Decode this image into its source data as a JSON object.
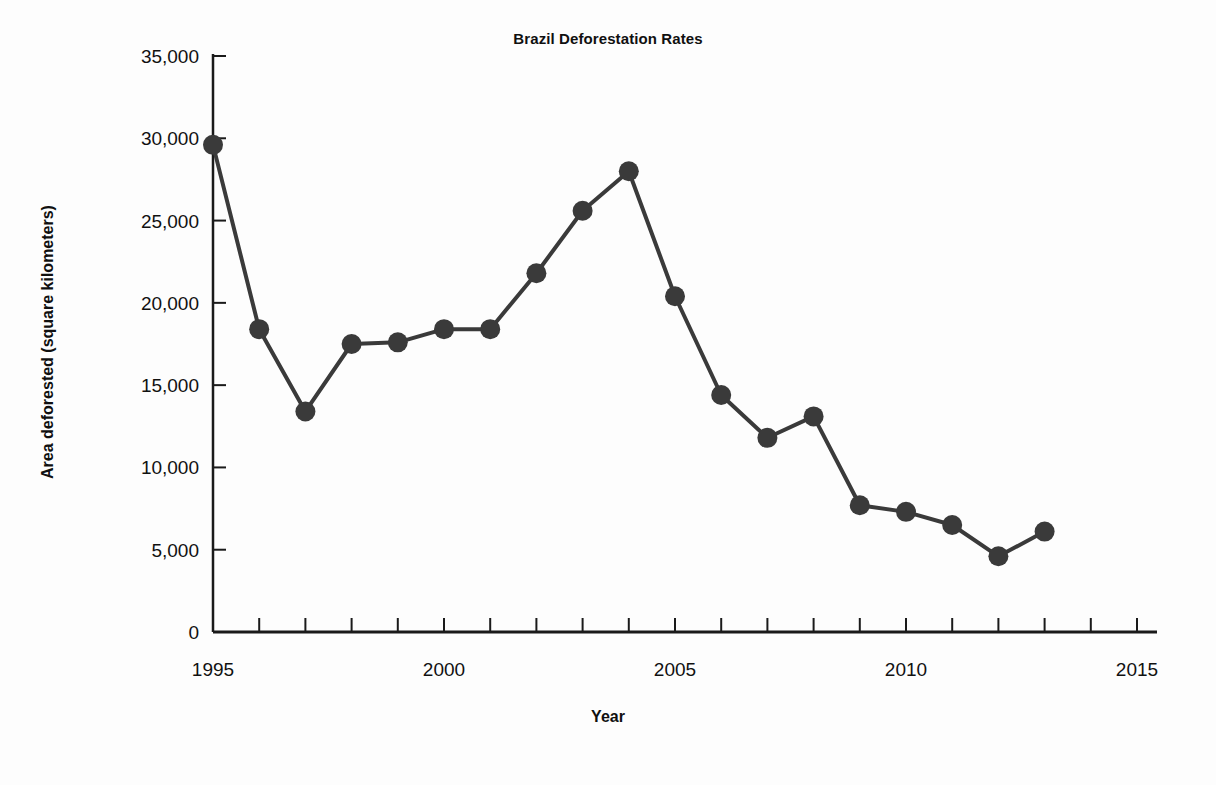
{
  "chart_data": {
    "type": "line",
    "title": "Brazil Deforestation Rates",
    "xlabel": "Year",
    "ylabel": "Area deforested (square kilometers)",
    "xlim": [
      1995,
      2015
    ],
    "ylim": [
      0,
      35000
    ],
    "grid": false,
    "legend": "none",
    "x": [
      1995,
      1996,
      1997,
      1998,
      1999,
      2000,
      2001,
      2002,
      2003,
      2004,
      2005,
      2006,
      2007,
      2008,
      2009,
      2010,
      2011,
      2012,
      2013
    ],
    "values": [
      29600,
      18400,
      13400,
      17500,
      17600,
      18400,
      18400,
      21800,
      25600,
      28000,
      20400,
      14400,
      11800,
      13100,
      7700,
      7300,
      6500,
      4600,
      6100
    ],
    "series": [
      {
        "name": "Area deforested",
        "values": [
          29600,
          18400,
          13400,
          17500,
          17600,
          18400,
          18400,
          21800,
          25600,
          28000,
          20400,
          14400,
          11800,
          13100,
          7700,
          7300,
          6500,
          4600,
          6100
        ]
      }
    ],
    "x_tick_labels": [
      "1995",
      "2000",
      "2005",
      "2010",
      "2015"
    ],
    "x_tick_values": [
      1995,
      2000,
      2005,
      2010,
      2015
    ],
    "x_minor_ticks": [
      1996,
      1997,
      1998,
      1999,
      2001,
      2002,
      2003,
      2004,
      2006,
      2007,
      2008,
      2009,
      2011,
      2012,
      2013,
      2014
    ],
    "y_tick_labels": [
      "0",
      "5,000",
      "10,000",
      "15,000",
      "20,000",
      "25,000",
      "30,000",
      "35,000"
    ],
    "y_tick_values": [
      0,
      5000,
      10000,
      15000,
      20000,
      25000,
      30000,
      35000
    ],
    "marker": "circle",
    "marker_size": 20,
    "line_width": 4,
    "colors": {
      "line": "#3a3a3a",
      "marker": "#3a3a3a",
      "axis": "#1a1a1a",
      "text": "#111111",
      "background": "#fdfdfd"
    }
  }
}
